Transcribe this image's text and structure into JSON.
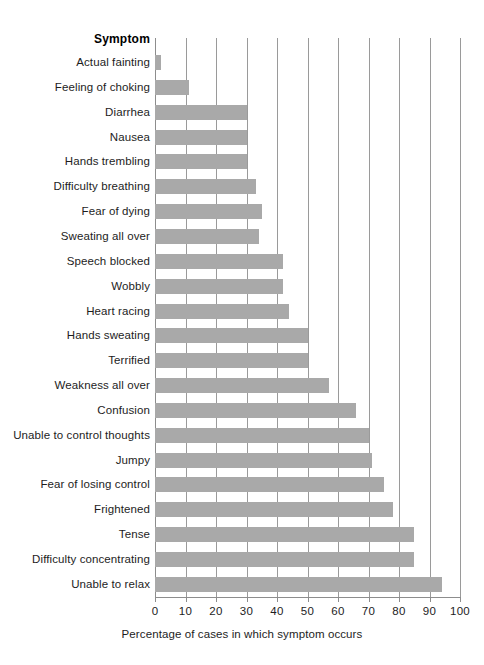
{
  "chart_data": {
    "type": "bar",
    "orientation": "horizontal",
    "title": "",
    "header_label": "Symptom",
    "xlabel": "Percentage of cases in which symptom occurs",
    "ylabel": "",
    "xlim": [
      0,
      100
    ],
    "xticks": [
      0,
      10,
      20,
      30,
      40,
      50,
      60,
      70,
      80,
      90,
      100
    ],
    "xtick_labels": [
      "0",
      "10",
      "20",
      "30",
      "40",
      "50",
      "60",
      "70",
      "80",
      "90",
      "100"
    ],
    "grid": "vertical",
    "legend": "none",
    "bar_color": "#a9a9a9",
    "categories": [
      "Actual fainting",
      "Feeling of choking",
      "Diarrhea",
      "Nausea",
      "Hands trembling",
      "Difficulty breathing",
      "Fear of dying",
      "Sweating all over",
      "Speech blocked",
      "Wobbly",
      "Heart racing",
      "Hands sweating",
      "Terrified",
      "Weakness all over",
      "Confusion",
      "Unable to control thoughts",
      "Jumpy",
      "Fear of losing control",
      "Frightened",
      "Tense",
      "Difficulty concentrating",
      "Unable to relax"
    ],
    "values": [
      2,
      11,
      30,
      30,
      30,
      33,
      35,
      34,
      42,
      42,
      44,
      50,
      50,
      57,
      66,
      70,
      71,
      75,
      78,
      85,
      85,
      94
    ]
  }
}
